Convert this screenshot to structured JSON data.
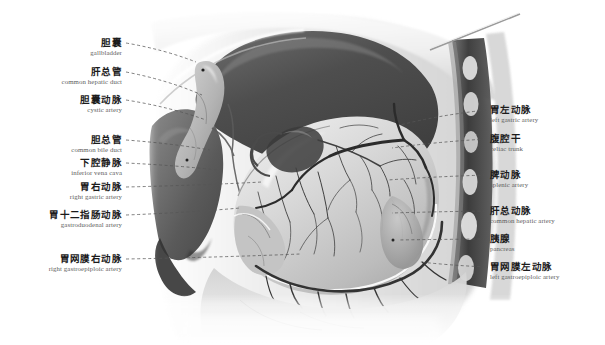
{
  "figure": {
    "style": "grayscale anatomical illustration",
    "colors": {
      "background": "#ffffff",
      "liver_dark": "#4a4a4a",
      "liver_mid": "#6e6e6e",
      "stomach_light": "#d8d8d8",
      "stomach_shadow": "#a8a8a8",
      "omentum": "#e2e2e2",
      "vessel": "#3c3c3c",
      "spine_dark": "#3a3a3a",
      "rib_light": "#e8e8e8",
      "leader_line": "#555555",
      "label_cn": "#1b1b1b",
      "label_en": "#5d5d5d"
    },
    "probe": {
      "name": "surgical-probe",
      "x1": 430,
      "y1": 50,
      "x2": 520,
      "y2": 14
    }
  },
  "labels_left": [
    {
      "cn": "胆囊",
      "en": "gallbladder",
      "x": 122,
      "y": 44,
      "tip_x": 196,
      "tip_y": 62
    },
    {
      "cn": "肝总管",
      "en": "common hepatic duct",
      "x": 122,
      "y": 73,
      "tip_x": 202,
      "tip_y": 95
    },
    {
      "cn": "胆囊动脉",
      "en": "cystic artery",
      "x": 122,
      "y": 101,
      "tip_x": 206,
      "tip_y": 120
    },
    {
      "cn": "胆总管",
      "en": "common bile duct",
      "x": 122,
      "y": 141,
      "tip_x": 210,
      "tip_y": 150
    },
    {
      "cn": "下腔静脉",
      "en": "inferior vena cava",
      "x": 122,
      "y": 164,
      "tip_x": 218,
      "tip_y": 170
    },
    {
      "cn": "胃右动脉",
      "en": "right gastric artery",
      "x": 122,
      "y": 188,
      "tip_x": 262,
      "tip_y": 182
    },
    {
      "cn": "胃十二指肠动脉",
      "en": "gastroduodenal artery",
      "x": 122,
      "y": 216,
      "tip_x": 240,
      "tip_y": 208
    },
    {
      "cn": "胃网膜右动脉",
      "en": "right gastroepiploic artery",
      "x": 122,
      "y": 260,
      "tip_x": 300,
      "tip_y": 254
    }
  ],
  "labels_right": [
    {
      "cn": "胃左动脉",
      "en": "left gastric artery",
      "x": 490,
      "y": 111,
      "tip_x": 400,
      "tip_y": 125
    },
    {
      "cn": "腹腔干",
      "en": "celiac trunk",
      "x": 490,
      "y": 140,
      "tip_x": 392,
      "tip_y": 148
    },
    {
      "cn": "脾动脉",
      "en": "splenic artery",
      "x": 490,
      "y": 176,
      "tip_x": 388,
      "tip_y": 180
    },
    {
      "cn": "肝总动脉",
      "en": "common hepatic artery",
      "x": 490,
      "y": 212,
      "tip_x": 392,
      "tip_y": 213
    },
    {
      "cn": "胰腺",
      "en": "pancreas",
      "x": 490,
      "y": 240,
      "tip_x": 398,
      "tip_y": 240
    },
    {
      "cn": "胃网膜左动脉",
      "en": "left gastroepiploic artery",
      "x": 490,
      "y": 268,
      "tip_x": 420,
      "tip_y": 262
    }
  ]
}
